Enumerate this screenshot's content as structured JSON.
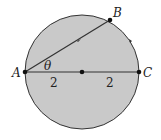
{
  "diagram": {
    "colors": {
      "fill": "#c9c9c9",
      "stroke": "#333333",
      "background": "#ffffff"
    },
    "points": {
      "A": {
        "label": "A"
      },
      "B": {
        "label": "B"
      },
      "C": {
        "label": "C"
      }
    },
    "angle_label": "θ",
    "segment_labels": [
      "2",
      "2"
    ]
  }
}
